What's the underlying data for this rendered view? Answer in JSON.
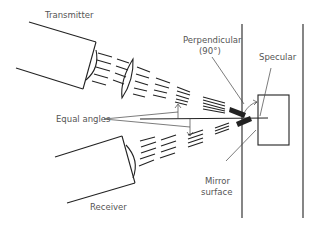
{
  "diagram": {
    "type": "specular-reflection-schematic",
    "labels": {
      "transmitter": "Transmitter",
      "receiver": "Receiver",
      "perpendicular_line1": "Perpendicular",
      "perpendicular_line2": "(90°)",
      "specular": "Specular",
      "equal_angles": "Equal angles",
      "mirror_line1": "Mirror",
      "mirror_line2": "surface"
    },
    "colors": {
      "ink": "#222222",
      "label": "#555555",
      "background": "#ffffff"
    }
  }
}
